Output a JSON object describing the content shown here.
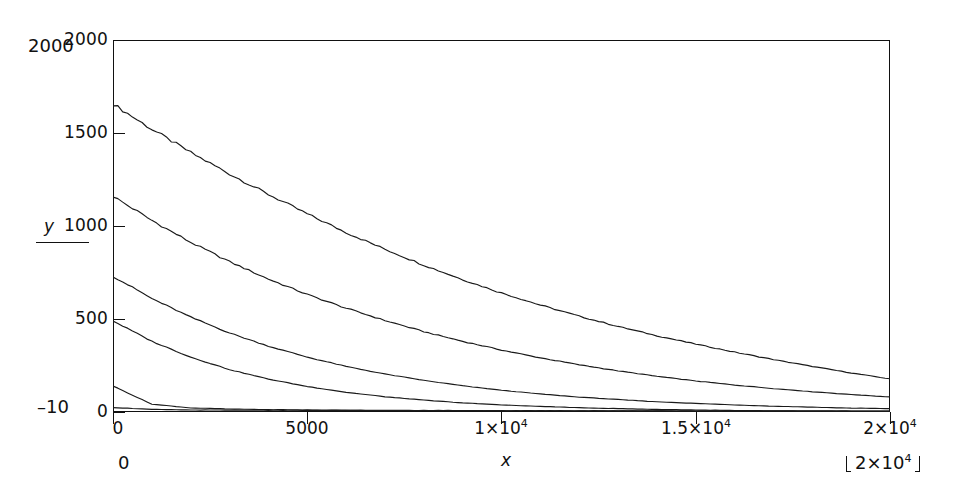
{
  "figure": {
    "background": "#ffffff",
    "line_color": "#1a1a1a",
    "axis_color": "#111111"
  },
  "axes": {
    "x_name": "x",
    "y_name": "y",
    "x_ticks": [
      {
        "value": 0,
        "label": "0"
      },
      {
        "value": 5000,
        "label": "5000"
      },
      {
        "value": 10000,
        "label": "1×10",
        "exp": "4"
      },
      {
        "value": 15000,
        "label": "1.5×10",
        "exp": "4"
      },
      {
        "value": 20000,
        "label": "2×10",
        "exp": "4"
      }
    ],
    "y_ticks": [
      {
        "value": 0,
        "label": "0"
      },
      {
        "value": 500,
        "label": "500"
      },
      {
        "value": 1000,
        "label": "1000"
      },
      {
        "value": 1500,
        "label": "1500"
      },
      {
        "value": 2000,
        "label": "2000"
      }
    ],
    "xlim": [
      0,
      20000
    ],
    "ylim": [
      0,
      2000
    ]
  },
  "annotations": {
    "y_upper_limit": "2000",
    "y_lower_limit": "–10",
    "x_lower_limit": "0",
    "x_upper_limit": "2×10",
    "x_upper_limit_exp": "4"
  },
  "chart_data": {
    "type": "line",
    "title": "",
    "xlabel": "x",
    "ylabel": "y",
    "xlim": [
      0,
      20000
    ],
    "ylim": [
      0,
      2000
    ],
    "xticks": [
      0,
      5000,
      10000,
      15000,
      20000
    ],
    "xticklabels": [
      "0",
      "5000",
      "1×10⁴",
      "1.5×10⁴",
      "2×10⁴"
    ],
    "yticks": [
      0,
      500,
      1000,
      1500,
      2000
    ],
    "yticklabels": [
      "0",
      "500",
      "1000",
      "1500",
      "2000"
    ],
    "grid": false,
    "legend": null,
    "x": [
      0,
      1000,
      2000,
      3000,
      4000,
      5000,
      6000,
      7000,
      8000,
      9000,
      10000,
      11000,
      12000,
      13000,
      14000,
      15000,
      16000,
      17000,
      18000,
      19000,
      20000
    ],
    "series": [
      {
        "name": "curve-1",
        "values": [
          1656,
          1520,
          1395,
          1280,
          1170,
          1065,
          965,
          875,
          790,
          712,
          640,
          575,
          515,
          460,
          410,
          365,
          322,
          282,
          245,
          210,
          178
        ]
      },
      {
        "name": "curve-2",
        "values": [
          1160,
          1030,
          912,
          808,
          715,
          632,
          558,
          492,
          432,
          380,
          333,
          291,
          254,
          221,
          192,
          167,
          145,
          126,
          109,
          94,
          81
        ]
      },
      {
        "name": "curve-3",
        "values": [
          730,
          610,
          510,
          425,
          354,
          295,
          245,
          204,
          170,
          141,
          117,
          97,
          80,
          67,
          55,
          46,
          38,
          31,
          26,
          21,
          18
        ]
      },
      {
        "name": "curve-4",
        "values": [
          490,
          380,
          295,
          228,
          177,
          137,
          106,
          82,
          64,
          49,
          38,
          30,
          23,
          18,
          14,
          11,
          8,
          6,
          5,
          4,
          3
        ]
      },
      {
        "name": "curve-5",
        "values": [
          140,
          42,
          22,
          16,
          13,
          11,
          10,
          9,
          8,
          8,
          7,
          7,
          6,
          6,
          6,
          5,
          5,
          5,
          5,
          4,
          4
        ]
      },
      {
        "name": "curve-6",
        "values": [
          24,
          14,
          11,
          10,
          9,
          9,
          8,
          8,
          8,
          7,
          7,
          7,
          7,
          6,
          6,
          6,
          6,
          5,
          5,
          5,
          5
        ]
      }
    ]
  }
}
